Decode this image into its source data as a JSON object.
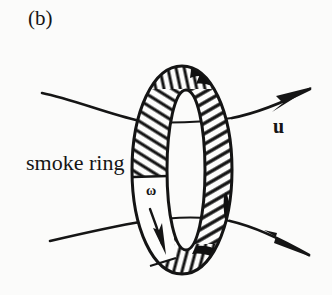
{
  "figure": {
    "panel_label": "(b)",
    "caption_label": "smoke ring",
    "velocity_label": "u",
    "vorticity_label": "ω",
    "background_color": "#fbfbfa",
    "ink_color": "#151515"
  },
  "diagram": {
    "elements": [
      {
        "name": "vortex-ring",
        "type": "torus-outline",
        "description": "hand-drawn elliptical ring (torus) shown nearly edge-on, hatched tube surface with white inner hole",
        "outer_ellipse": {
          "cx": 182,
          "cy": 170,
          "rx": 50,
          "ry": 104
        },
        "inner_ellipse": {
          "cx": 186,
          "cy": 170,
          "rx": 19,
          "ry": 80
        }
      },
      {
        "name": "upper-flow-line",
        "type": "streamline-arrow",
        "description": "flow line entering at upper left, passing behind ring, exiting upper right with arrowhead",
        "start": [
          42,
          93
        ],
        "end": [
          312,
          88
        ],
        "has_arrowhead": true,
        "arrow_label": "u"
      },
      {
        "name": "lower-flow-line",
        "type": "streamline-arrow",
        "description": "flow line entering at lower left, passing behind ring, exiting lower right with arrowhead",
        "start": [
          50,
          241
        ],
        "end": [
          311,
          256
        ],
        "has_arrowhead": true
      },
      {
        "name": "vorticity-arrow",
        "type": "circulation-arrow",
        "description": "short arrow on white band of the ring tube indicating sense of rotation (vorticity) directed downward",
        "start": [
          152,
          208
        ],
        "end": [
          164,
          250
        ],
        "has_arrowhead": true,
        "arrow_label": "ω"
      },
      {
        "name": "shadow-patch-top",
        "type": "solid-shading",
        "description": "solid dark shading at the top right of the ring tube"
      },
      {
        "name": "shadow-patch-bottom",
        "type": "solid-shading",
        "description": "solid dark shading at the bottom right of the ring tube"
      }
    ]
  }
}
